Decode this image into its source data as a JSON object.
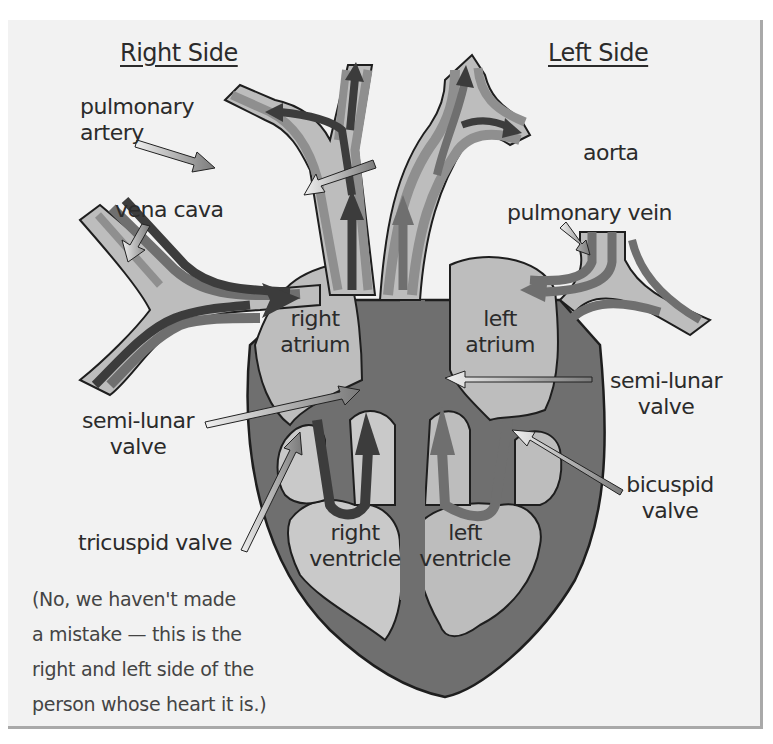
{
  "headings": {
    "right_side": "Right Side",
    "left_side": "Left Side"
  },
  "labels": {
    "pulmonary_artery": [
      "pulmonary",
      "artery"
    ],
    "aorta": "aorta",
    "vena_cava": "vena cava",
    "pulmonary_vein": "pulmonary vein",
    "right_atrium": [
      "right",
      "atrium"
    ],
    "left_atrium": [
      "left",
      "atrium"
    ],
    "semi_lunar_valve_right": [
      "semi-lunar",
      "valve"
    ],
    "semi_lunar_valve_left": [
      "semi-lunar",
      "valve"
    ],
    "bicuspid_valve": [
      "bicuspid",
      "valve"
    ],
    "tricuspid_valve": "tricuspid valve",
    "right_ventricle": [
      "right",
      "ventricle"
    ],
    "left_ventricle": [
      "left",
      "ventricle"
    ]
  },
  "note": [
    "(No, we haven't made",
    "a mistake — this is the",
    "right and left side of the",
    "person whose heart it is.)"
  ],
  "colors": {
    "panel_bg": "#f2f2f2",
    "wall": "#6f6f6f",
    "vessel_mid": "#8f8f8f",
    "chamber": "#bdbdbd",
    "chamber_light": "#cfcfcf",
    "flow_arrow": "#3c3c3c",
    "pointer_arrow": "#d6d6d6"
  }
}
